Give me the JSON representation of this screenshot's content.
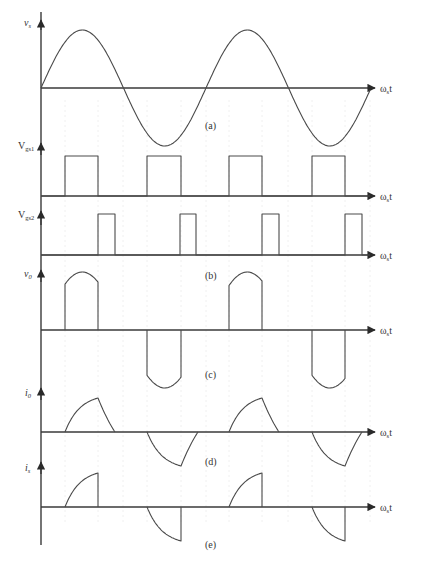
{
  "figure": {
    "width": 427,
    "height": 565,
    "x_axis_label": "ωst",
    "x_axis_label_main": "ω",
    "x_axis_label_sub": "s",
    "x_axis_label_tail": "t"
  },
  "panels": [
    {
      "id": "a",
      "caption": "(a)",
      "y_label_main": "v",
      "y_label_sub": "s",
      "signal": "supply voltage (sinusoid)"
    },
    {
      "id": "b1",
      "caption": "",
      "y_label_main": "V",
      "y_label_sub": "gs1",
      "signal": "gate signal 1"
    },
    {
      "id": "b2",
      "caption": "(b)",
      "y_label_main": "V",
      "y_label_sub": "gs2",
      "signal": "gate signal 2"
    },
    {
      "id": "c",
      "caption": "(c)",
      "y_label_main": "v",
      "y_label_sub": "0",
      "signal": "output voltage"
    },
    {
      "id": "d",
      "caption": "(d)",
      "y_label_main": "i",
      "y_label_sub": "0",
      "signal": "output current"
    },
    {
      "id": "e",
      "caption": "(e)",
      "y_label_main": "i",
      "y_label_sub": "s",
      "signal": "supply current"
    }
  ],
  "timing": {
    "sine_period_px": 165,
    "gate1_pulses_x": [
      [
        65,
        98
      ],
      [
        147,
        181
      ],
      [
        229,
        262
      ],
      [
        312,
        345
      ]
    ],
    "gate2_pulses_x": [
      [
        98,
        115
      ],
      [
        180,
        196
      ],
      [
        262,
        279
      ],
      [
        345,
        362
      ]
    ],
    "polarity": [
      "+",
      "-",
      "+",
      "-"
    ]
  }
}
